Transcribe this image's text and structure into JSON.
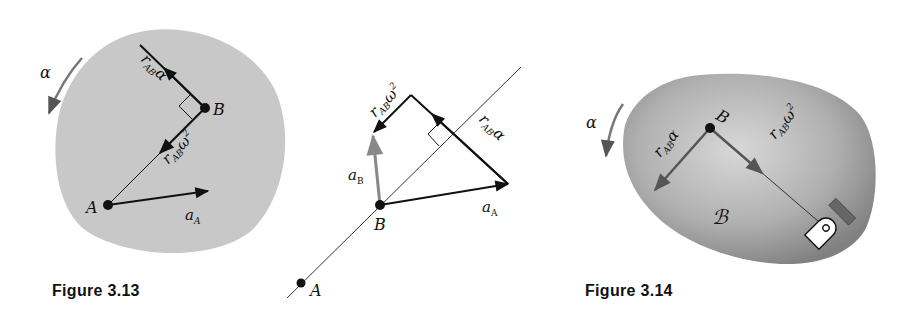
{
  "figures": [
    {
      "caption": "Figure 3.13",
      "body_color": "#c8c8c8",
      "rotation_label": "α",
      "points": [
        {
          "name": "A",
          "label": "A"
        },
        {
          "name": "B",
          "label": "B"
        }
      ],
      "vectors": [
        {
          "name": "r_AB_alpha",
          "main": "r",
          "sub": "AB",
          "tail": "α"
        },
        {
          "name": "r_AB_omega2",
          "main": "r",
          "sub": "AB",
          "tail": "ω",
          "sup": "2"
        },
        {
          "name": "a_A",
          "main": "a",
          "sub": "A"
        }
      ]
    },
    {
      "caption": "",
      "points": [
        {
          "name": "A",
          "label": "A"
        },
        {
          "name": "B",
          "label": "B"
        }
      ],
      "vectors": [
        {
          "name": "a_A",
          "main": "a",
          "sub": "A"
        },
        {
          "name": "r_AB_alpha",
          "main": "r",
          "sub": "AB",
          "tail": "α"
        },
        {
          "name": "r_AB_omega2",
          "main": "r",
          "sub": "AB",
          "tail": "ω",
          "sup": "2"
        },
        {
          "name": "a_B",
          "main": "a",
          "sub": "B",
          "color": "#888888"
        }
      ]
    },
    {
      "caption": "Figure 3.14",
      "body_color": "#a0a0a0",
      "rotation_label": "α",
      "body_label": "ℬ",
      "points": [
        {
          "name": "B",
          "label": "B"
        }
      ],
      "vectors": [
        {
          "name": "r_AB_alpha",
          "main": "r",
          "sub": "AB",
          "tail": "α"
        },
        {
          "name": "r_AB_omega2",
          "main": "r",
          "sub": "AB",
          "tail": "ω",
          "sup": "2"
        }
      ]
    }
  ]
}
